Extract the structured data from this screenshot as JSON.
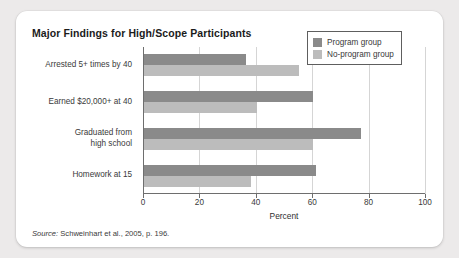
{
  "chart_data": {
    "type": "bar",
    "orientation": "horizontal",
    "title": "Major Findings for High/Scope Participants",
    "xlabel": "Percent",
    "ylabel": "",
    "xlim": [
      0,
      100
    ],
    "xticks": [
      0,
      20,
      40,
      60,
      80,
      100
    ],
    "xtick_labels": [
      "0",
      "20",
      "40",
      "60",
      "80",
      "100"
    ],
    "grid": true,
    "grid_axis": "x",
    "legend_position": "top-right",
    "categories": [
      "Arrested 5+ times by 40",
      "Earned $20,000+ at 40",
      "Graduated from\nhigh school",
      "Homework at 15"
    ],
    "series": [
      {
        "name": "Program group",
        "color": "#8a8a8a",
        "values": [
          36,
          60,
          77,
          61
        ]
      },
      {
        "name": "No-program group",
        "color": "#bcbcbc",
        "values": [
          55,
          40,
          60,
          38
        ]
      }
    ]
  },
  "figure": {
    "title": "Major Findings for High/Scope Participants",
    "source_prefix": "Source:",
    "source_text": "Schweinhart et al., 2005, p. 196.",
    "xaxis_title": "Percent"
  },
  "legend": {
    "items": [
      {
        "label": "Program group",
        "color": "#8a8a8a"
      },
      {
        "label": "No-program group",
        "color": "#bcbcbc"
      }
    ]
  },
  "colors": {
    "page_background": "#eceaea",
    "card_background": "#ffffff",
    "program_group": "#8a8a8a",
    "no_program_group": "#bcbcbc",
    "axis": "#6e6e6e",
    "gridline": "#d5d5d5",
    "text": "#3a3a3a",
    "title_text": "#1b1b1b"
  }
}
